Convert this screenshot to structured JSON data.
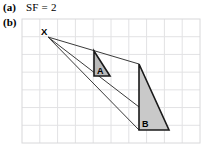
{
  "parts": {
    "a_marker": "(a)",
    "a_answer": "SF = 2",
    "b_marker": "(b)"
  },
  "diagram": {
    "grid": {
      "x": 22,
      "y": 19,
      "width": 178,
      "height": 124,
      "cell_size": 17.8,
      "cols": 10,
      "rows": 7,
      "line_color": "#e2e2e4",
      "border_color": "#d8d8da"
    },
    "centre": {
      "label": "X",
      "x": 48,
      "y": 37,
      "label_x": 41,
      "label_y": 35
    },
    "shape_a": {
      "label": "A",
      "label_x": 97,
      "label_y": 74,
      "points": "94,51 94,76 110,76",
      "fill": "#b9b9b9",
      "stroke": "#1a1a1a"
    },
    "shape_b": {
      "label": "B",
      "label_x": 142,
      "label_y": 127,
      "points": "139,64 139,130 169,130",
      "fill": "#c9c9c9",
      "stroke": "#1a1a1a"
    },
    "rays": [
      {
        "name": "ray-to-apex",
        "x1": 48,
        "y1": 37,
        "x2": 139,
        "y2": 64
      },
      {
        "name": "ray-to-bottom-left",
        "x1": 48,
        "y1": 37,
        "x2": 139,
        "y2": 130
      },
      {
        "name": "ray-to-bottom-right",
        "x1": 48,
        "y1": 37,
        "x2": 169,
        "y2": 130
      }
    ],
    "ray_color": "#3a3a3a"
  }
}
